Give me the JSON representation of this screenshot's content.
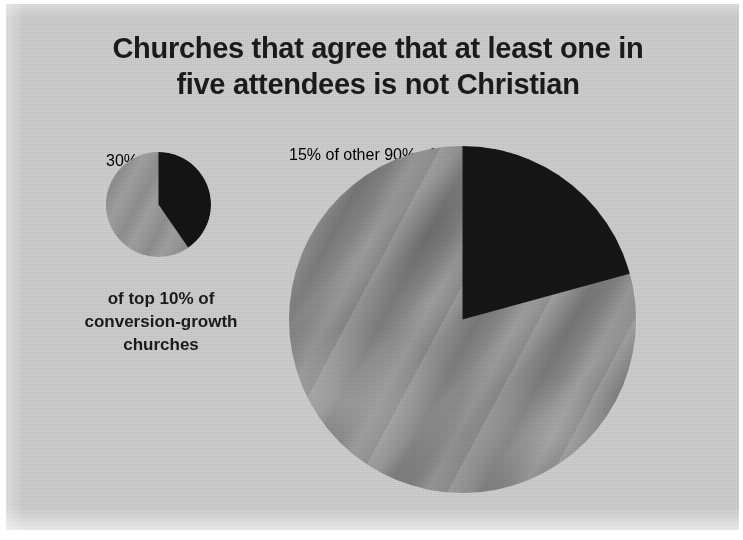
{
  "slide": {
    "title_lines": [
      "Churches that agree that at least one in",
      "five attendees is not Christian"
    ],
    "background_color": "#cfcfcf",
    "text_color": "#1b1b1b",
    "slice_color": "#141414",
    "remainder_color": "#8c8c8c",
    "label_color": "#ffffff"
  },
  "small_pie": {
    "slice_label": "30%",
    "caption_lines": [
      "of top 10% of",
      "conversion-growth",
      "churches"
    ]
  },
  "large_pie": {
    "slice_label": "15%",
    "inner_lines": [
      "of other",
      "90% of",
      "churches"
    ]
  },
  "chart_data": [
    {
      "type": "pie",
      "title": "of top 10% of conversion-growth churches",
      "categories": [
        "Agree at least one in five attendees is not Christian",
        "Other"
      ],
      "values": [
        30,
        70
      ],
      "labels": [
        "30%",
        ""
      ],
      "colors": [
        "#141414",
        "#9a9a9a"
      ],
      "start_angle_deg": 0,
      "direction": "clockwise",
      "legend": "none",
      "grid": false
    },
    {
      "type": "pie",
      "title": "of other 90% of churches",
      "categories": [
        "Agree at least one in five attendees is not Christian",
        "Other"
      ],
      "values": [
        15,
        85
      ],
      "labels": [
        "15%",
        ""
      ],
      "colors": [
        "#161616",
        "#8c8c8c"
      ],
      "start_angle_deg": 0,
      "direction": "clockwise",
      "legend": "none",
      "grid": false
    }
  ]
}
